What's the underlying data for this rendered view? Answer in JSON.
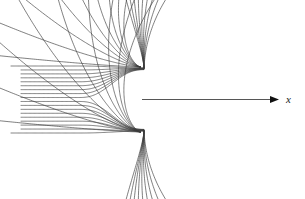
{
  "figure": {
    "type": "streamline-field-diagram",
    "width": 305,
    "height": 199,
    "background_color": "#ffffff",
    "line_color": "#3a3a3a",
    "line_width": 0.65,
    "axis": {
      "name": "x-axis",
      "label": "x",
      "label_style": "italic",
      "label_position": {
        "x": 286,
        "y": 94
      },
      "start": {
        "x": 142,
        "y": 99.5
      },
      "end": {
        "x": 272,
        "y": 99.5
      },
      "arrowhead": {
        "name": "arrow-right",
        "tip_x": 279,
        "tip_y": 99.5,
        "length": 9,
        "half_width": 3.6,
        "color": "#111111"
      }
    },
    "stagnation": {
      "center_x": 142,
      "center_y": 99.5,
      "upper_focus_x": 142,
      "upper_focus_y": 68,
      "lower_focus_x": 142,
      "lower_focus_y": 131
    }
  },
  "chart_data": {
    "type": "line",
    "xlabel": "x",
    "ylabel": "",
    "grid": false,
    "legend": null,
    "bundle": {
      "name": "incoming-parallel-streamlines",
      "count": 18,
      "y_top": 66.0,
      "y_bottom": 133.0,
      "left_x_outer": 11,
      "left_x_inner": 21,
      "neck_x": 142
    },
    "upper_fan": {
      "name": "upper-fan-streamlines",
      "count": 9,
      "exit_angles_deg": [
        172,
        150,
        126,
        103,
        82,
        62,
        44,
        28,
        14
      ]
    },
    "lower_fan": {
      "name": "lower-fan-streamlines",
      "count": 9,
      "exit_angles_deg": [
        188,
        210,
        234,
        257,
        278,
        298,
        316,
        332,
        346
      ]
    },
    "axis_streamline": {
      "name": "axis-streamline",
      "x_start": 142,
      "x_end": 272,
      "y": 99.5
    }
  }
}
